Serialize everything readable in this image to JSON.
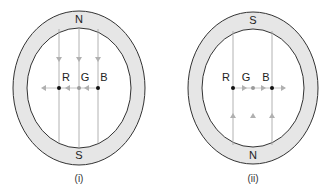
{
  "diagrams": [
    {
      "caption": "(i)",
      "top_pole": "N",
      "bottom_pole": "S",
      "labels": [
        "R",
        "G",
        "B"
      ],
      "field_direction": "down",
      "force_direction": "left"
    },
    {
      "caption": "(ii)",
      "top_pole": "S",
      "bottom_pole": "N",
      "labels": [
        "R",
        "G",
        "B"
      ],
      "field_direction": "up",
      "force_direction": "right"
    }
  ],
  "colors": {
    "ring_fill": "#e6e6e6",
    "ring_stroke": "#333333",
    "field_line": "#9a9a9a",
    "arrow": "#b0b0b0",
    "dot_dark": "#111111",
    "dot_gray": "#9a9a9a"
  }
}
